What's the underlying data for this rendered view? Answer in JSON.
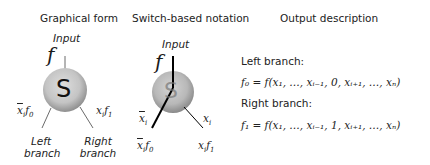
{
  "headers": {
    "graphical_form": "Graphical form",
    "switch_notation": "Switch-based notation",
    "output_description": "Output description"
  },
  "graphical": {
    "input_label": "Input",
    "input_symbol": "f",
    "node_letter": "S",
    "left_edge_label_x": "x",
    "left_edge_label_sub": "i",
    "left_edge_label_f": "f",
    "left_edge_label_fsub": "0",
    "right_edge_label_x": "x",
    "right_edge_label_sub": "i",
    "right_edge_label_f": "f",
    "right_edge_label_fsub": "1",
    "left_branch_label_1": "Left",
    "left_branch_label_2": "branch",
    "right_branch_label_1": "Right",
    "right_branch_label_2": "branch"
  },
  "switch": {
    "input_label": "Input",
    "input_symbol": "f",
    "node_letter": "S",
    "left_var": "x",
    "left_var_sub": "i",
    "right_var": "x",
    "right_var_sub": "i",
    "left_out": "x",
    "left_out_sub": "i",
    "left_out_f": "f",
    "left_out_fsub": "0",
    "right_out": "x",
    "right_out_sub": "i",
    "right_out_f": "f",
    "right_out_fsub": "1"
  },
  "output": {
    "left_title": "Left branch:",
    "left_formula": "f₀ = f(x₁, …, xᵢ₋₁, 0,  xᵢ₊₁, …, xₙ)",
    "right_title": "Right branch:",
    "right_formula": "f₁ = f(x₁, …, xᵢ₋₁, 1,  xᵢ₊₁, …, xₙ)"
  },
  "colors": {
    "node_light": "#d9d9d9",
    "node_dark": "#9a9a9a",
    "line": "#333333",
    "switch_line": "#000000"
  }
}
